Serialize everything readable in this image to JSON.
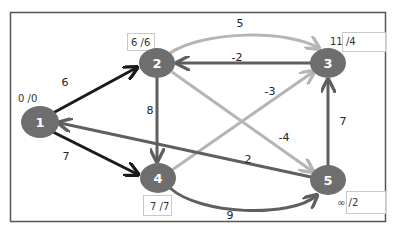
{
  "colors": {
    "node_fill": "#6e6e6e",
    "node_text": "#ffffff",
    "edge_dark": "#1a1a1a",
    "edge_medium": "#5f5f5f",
    "edge_light": "#b5b5b5",
    "frame": "#555555",
    "label_box": "#c8c8c8"
  },
  "nodes": [
    {
      "id": "1",
      "label": "1",
      "cx": 40,
      "cy": 122,
      "dist_label": "0 /0"
    },
    {
      "id": "2",
      "label": "2",
      "cx": 157,
      "cy": 63,
      "dist_label": "6 /6"
    },
    {
      "id": "3",
      "label": "3",
      "cx": 328,
      "cy": 63,
      "dist_label": "11 /4"
    },
    {
      "id": "4",
      "label": "4",
      "cx": 158,
      "cy": 178,
      "dist_label": "7 /7"
    },
    {
      "id": "5",
      "label": "5",
      "cx": 328,
      "cy": 180,
      "dist_label": "∞ /2"
    }
  ],
  "edges": [
    {
      "from": "1",
      "to": "2",
      "weight": "6",
      "style": "dark"
    },
    {
      "from": "1",
      "to": "4",
      "weight": "7",
      "style": "dark"
    },
    {
      "from": "2",
      "to": "3",
      "weight": "5",
      "style": "light",
      "curved": true
    },
    {
      "from": "3",
      "to": "2",
      "weight": "-2",
      "style": "medium"
    },
    {
      "from": "2",
      "to": "4",
      "weight": "8",
      "style": "medium"
    },
    {
      "from": "4",
      "to": "3",
      "weight": "-3",
      "style": "light"
    },
    {
      "from": "2",
      "to": "5",
      "weight": "-4",
      "style": "light"
    },
    {
      "from": "5",
      "to": "1",
      "weight": "2",
      "style": "medium"
    },
    {
      "from": "5",
      "to": "3",
      "weight": "7",
      "style": "medium"
    },
    {
      "from": "4",
      "to": "5",
      "weight": "9",
      "style": "medium",
      "curved": true
    }
  ]
}
